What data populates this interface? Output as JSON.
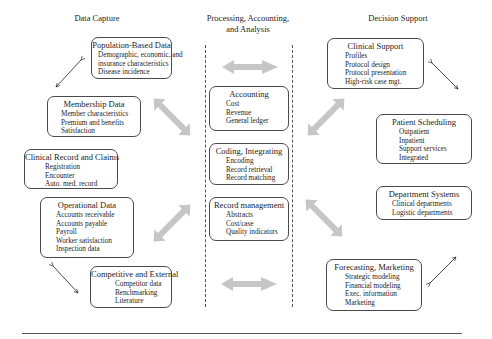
{
  "columns": {
    "left": {
      "title": "Data Capture"
    },
    "center": {
      "title_line1": "Processing, Accounting,",
      "title_line2": "and Analysis"
    },
    "right": {
      "title": "Decision Support"
    }
  },
  "data_capture": [
    {
      "title": "Population-Based Data",
      "items": [
        "Demographic, economic, and",
        "insurance characteristics",
        "Disease incidence"
      ]
    },
    {
      "title": "Membership Data",
      "items": [
        "Member characteristics",
        "Premium and benefits",
        "Satisfaction"
      ]
    },
    {
      "title": "Clinical Record and Claims",
      "items": [
        "Registration",
        "Encounter",
        "Auto. med. record"
      ]
    },
    {
      "title": "Operational Data",
      "items": [
        "Accounts receivable",
        "Accounts payable",
        "Payroll",
        "Worker satisfaction",
        "Inspection data"
      ]
    },
    {
      "title": "Competitive and External",
      "items": [
        "Competitor data",
        "Benchmarking",
        "Literature"
      ]
    }
  ],
  "processing": [
    {
      "title": "Accounting",
      "items": [
        "Cost",
        "Revenue",
        "General ledger"
      ]
    },
    {
      "title": "Coding, Integrating",
      "items": [
        "Encoding",
        "Record retrieval",
        "Record matching"
      ]
    },
    {
      "title": "Record management",
      "items": [
        "Abstracts",
        "Cost/case",
        "Quality indicators"
      ]
    }
  ],
  "decision_support": [
    {
      "title": "Clinical Support",
      "items": [
        "Profiles",
        "Protocol design",
        "Protocol presentation",
        "High-risk case mgt."
      ]
    },
    {
      "title": "Patient Scheduling",
      "items": [
        "Outpatient",
        "Inpatient",
        "Support services",
        "Integrated"
      ]
    },
    {
      "title": "Department Systems",
      "items": [
        "Clinical departments",
        "Logistic departments"
      ]
    },
    {
      "title": "Forecasting, Marketing",
      "items": [
        "Strategic modeling",
        "Financial modeling",
        "Exec. information",
        "Marketing"
      ]
    }
  ],
  "colors": {
    "box_border": "#4a4a4a",
    "gray_arrow": "#c4c4c4",
    "thin_arrow": "#222222",
    "dashed_line": "#555555"
  }
}
